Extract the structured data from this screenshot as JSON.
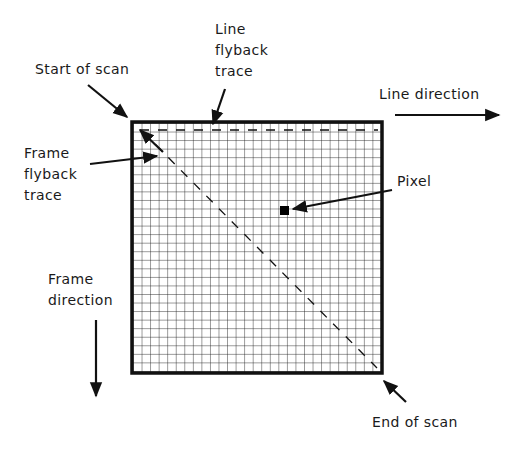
{
  "diagram": {
    "labels": {
      "start_of_scan": "Start of scan",
      "line_flyback_trace": "Line\nflyback\ntrace",
      "line_direction": "Line direction",
      "frame_flyback_trace": "Frame\nflyback\ntrace",
      "pixel": "Pixel",
      "frame_direction": "Frame\ndirection",
      "end_of_scan": "End of scan"
    },
    "grid": {
      "columns": 29,
      "rows": 29,
      "frame_color": "#111111",
      "grid_color": "#222222",
      "background": "#ffffff"
    }
  }
}
